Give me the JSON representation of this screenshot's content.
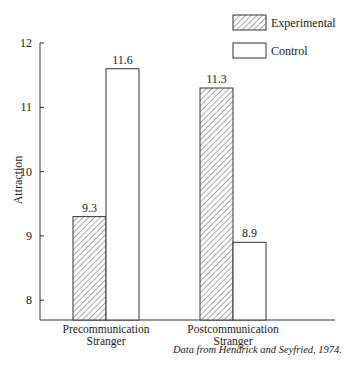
{
  "chart_data": {
    "type": "bar",
    "title": "",
    "xlabel": "",
    "ylabel": "Attraction",
    "ylim": [
      7.7,
      12
    ],
    "yticks": [
      8,
      9,
      10,
      11,
      12
    ],
    "categories": [
      [
        "Precommunication",
        "Stranger"
      ],
      [
        "Postcommunication",
        "Stranger"
      ]
    ],
    "series": [
      {
        "name": "Experimental",
        "pattern": "hatched",
        "values": [
          9.3,
          11.3
        ],
        "labels": [
          "9.3",
          "11.3"
        ]
      },
      {
        "name": "Control",
        "pattern": "open",
        "values": [
          11.6,
          8.9
        ],
        "labels": [
          "11.6",
          "8.9"
        ]
      }
    ],
    "legend_position": "top-right",
    "grid": false,
    "source_note": "Data from Hendrick and Seyfried, 1974."
  }
}
